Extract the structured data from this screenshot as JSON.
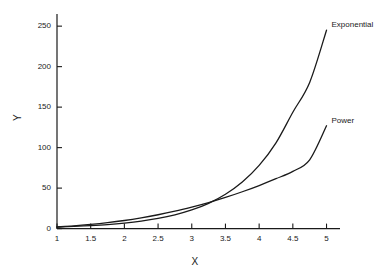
{
  "chart_data": {
    "type": "line",
    "title": "",
    "xlabel": "X",
    "ylabel": "Y",
    "xlim": [
      1,
      5.2
    ],
    "ylim": [
      0,
      265
    ],
    "grid": false,
    "legend_position": "inline-right",
    "xticks": [
      "1",
      "1.5",
      "2",
      "2.5",
      "3",
      "3.5",
      "4",
      "4.5",
      "5"
    ],
    "xtick_values": [
      1,
      1.5,
      2,
      2.5,
      3,
      3.5,
      4,
      4.5,
      5
    ],
    "yticks": [
      "0",
      "50",
      "100",
      "150",
      "200",
      "250"
    ],
    "ytick_values": [
      0,
      50,
      100,
      150,
      200,
      250
    ],
    "x": [
      1,
      1.25,
      1.5,
      1.75,
      2,
      2.25,
      2.5,
      2.75,
      3,
      3.25,
      3.5,
      3.75,
      4,
      4.25,
      4.5,
      4.75,
      5
    ],
    "series": [
      {
        "name": "Exponential",
        "label": "Exponential",
        "color": "#1a1a1a",
        "values": [
          2.0,
          2.7,
          3.7,
          5.0,
          6.8,
          9.2,
          12.5,
          17.0,
          23.0,
          31.2,
          42.4,
          57.5,
          78.0,
          105.9,
          143.7,
          180.5,
          245.0
        ]
      },
      {
        "name": "Power",
        "label": "Power",
        "color": "#1a1a1a",
        "values": [
          2.0,
          3.3,
          5.1,
          7.3,
          10.0,
          13.3,
          17.1,
          21.5,
          26.6,
          32.2,
          38.5,
          45.5,
          53.2,
          61.6,
          70.7,
          85.0,
          127.0
        ]
      }
    ],
    "annotations": [
      {
        "text": "Exponential",
        "x": 5.0,
        "y": 252
      },
      {
        "text": "Power",
        "x": 5.0,
        "y": 133
      }
    ]
  }
}
